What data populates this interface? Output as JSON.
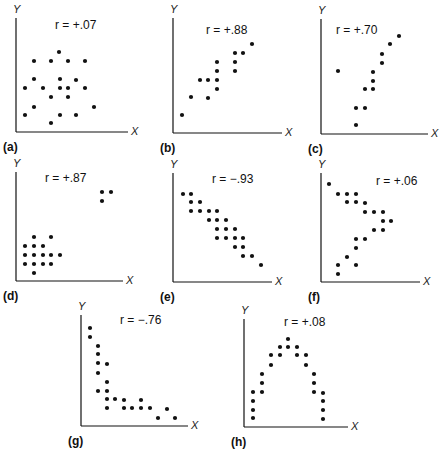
{
  "chart_data": [
    {
      "id": "a",
      "type": "scatter",
      "panel_label": "(a)",
      "annotation": "r = +.07",
      "r": 0.07,
      "xlabel": "X",
      "ylabel": "Y",
      "grid": false,
      "origin": [
        16,
        132
      ],
      "offset": [
        0,
        0
      ],
      "axis_end": [
        128,
        18
      ],
      "label_pos": [
        55,
        24
      ],
      "points": [
        [
          59,
          52
        ],
        [
          34,
          61
        ],
        [
          51,
          61
        ],
        [
          68,
          61
        ],
        [
          85,
          61
        ],
        [
          34,
          79
        ],
        [
          60,
          79
        ],
        [
          76,
          80
        ],
        [
          25,
          88
        ],
        [
          43,
          88
        ],
        [
          60,
          88
        ],
        [
          68,
          88
        ],
        [
          85,
          88
        ],
        [
          51,
          97
        ],
        [
          68,
          97
        ],
        [
          34,
          107
        ],
        [
          94,
          107
        ],
        [
          25,
          115
        ],
        [
          60,
          115
        ],
        [
          76,
          115
        ],
        [
          51,
          123
        ]
      ]
    },
    {
      "id": "b",
      "type": "scatter",
      "panel_label": "(b)",
      "annotation": "r = +.88",
      "r": 0.88,
      "xlabel": "X",
      "ylabel": "Y",
      "grid": false,
      "origin": [
        25,
        133
      ],
      "offset": [
        148,
        0
      ],
      "axis_end": [
        134,
        18
      ],
      "label_pos": [
        58,
        29
      ],
      "points": [
        [
          104,
          44
        ],
        [
          87,
          53
        ],
        [
          95,
          53
        ],
        [
          69,
          62
        ],
        [
          87,
          62
        ],
        [
          69,
          71
        ],
        [
          87,
          71
        ],
        [
          52,
          80
        ],
        [
          60,
          80
        ],
        [
          69,
          80
        ],
        [
          69,
          89
        ],
        [
          43,
          97
        ],
        [
          60,
          98
        ],
        [
          34,
          115
        ]
      ]
    },
    {
      "id": "c",
      "type": "scatter",
      "panel_label": "(c)",
      "annotation": "r = +.70",
      "r": 0.7,
      "xlabel": "X",
      "ylabel": "Y",
      "grid": false,
      "origin": [
        25,
        134
      ],
      "offset": [
        296,
        0
      ],
      "axis_end": [
        132,
        19
      ],
      "label_pos": [
        40,
        29
      ],
      "points": [
        [
          103,
          36
        ],
        [
          94,
          44
        ],
        [
          86,
          54
        ],
        [
          86,
          63
        ],
        [
          42,
          71
        ],
        [
          77,
          72
        ],
        [
          77,
          81
        ],
        [
          69,
          89
        ],
        [
          77,
          89
        ],
        [
          60,
          108
        ],
        [
          69,
          108
        ],
        [
          60,
          125
        ]
      ]
    },
    {
      "id": "d",
      "type": "scatter",
      "panel_label": "(d)",
      "annotation": "r = +.87",
      "r": 0.87,
      "xlabel": "X",
      "ylabel": "Y",
      "grid": false,
      "origin": [
        16,
        136
      ],
      "offset": [
        0,
        145
      ],
      "axis_end": [
        123,
        27
      ],
      "label_pos": [
        45,
        32
      ],
      "points": [
        [
          102,
          47
        ],
        [
          111,
          47
        ],
        [
          102,
          56
        ],
        [
          34,
          92
        ],
        [
          51,
          92
        ],
        [
          25,
          101
        ],
        [
          34,
          101
        ],
        [
          43,
          101
        ],
        [
          25,
          110
        ],
        [
          34,
          110
        ],
        [
          43,
          110
        ],
        [
          51,
          110
        ],
        [
          60,
          110
        ],
        [
          25,
          119
        ],
        [
          34,
          119
        ],
        [
          43,
          119
        ],
        [
          51,
          119
        ],
        [
          34,
          128
        ]
      ]
    },
    {
      "id": "e",
      "type": "scatter",
      "panel_label": "(e)",
      "annotation": "r = −.93",
      "r": -0.93,
      "xlabel": "X",
      "ylabel": "Y",
      "grid": false,
      "origin": [
        25,
        137
      ],
      "offset": [
        148,
        145
      ],
      "axis_end": [
        124,
        28
      ],
      "label_pos": [
        64,
        33
      ],
      "points": [
        [
          35,
          49
        ],
        [
          43,
          49
        ],
        [
          43,
          57
        ],
        [
          52,
          57
        ],
        [
          43,
          66
        ],
        [
          52,
          66
        ],
        [
          61,
          66
        ],
        [
          69,
          66
        ],
        [
          61,
          75
        ],
        [
          69,
          75
        ],
        [
          78,
          75
        ],
        [
          69,
          84
        ],
        [
          78,
          84
        ],
        [
          87,
          84
        ],
        [
          69,
          93
        ],
        [
          78,
          93
        ],
        [
          87,
          93
        ],
        [
          95,
          93
        ],
        [
          87,
          102
        ],
        [
          95,
          102
        ],
        [
          95,
          111
        ],
        [
          104,
          111
        ],
        [
          113,
          120
        ]
      ]
    },
    {
      "id": "f",
      "type": "scatter",
      "panel_label": "(f)",
      "annotation": "r = +.06",
      "r": 0.06,
      "xlabel": "X",
      "ylabel": "Y",
      "grid": false,
      "origin": [
        25,
        137
      ],
      "offset": [
        296,
        145
      ],
      "axis_end": [
        124,
        28
      ],
      "label_pos": [
        80,
        35
      ],
      "points": [
        [
          33,
          39
        ],
        [
          42,
          49
        ],
        [
          51,
          49
        ],
        [
          60,
          49
        ],
        [
          51,
          57
        ],
        [
          60,
          57
        ],
        [
          69,
          58
        ],
        [
          69,
          67
        ],
        [
          78,
          67
        ],
        [
          87,
          67
        ],
        [
          87,
          76
        ],
        [
          95,
          76
        ],
        [
          78,
          85
        ],
        [
          87,
          85
        ],
        [
          60,
          94
        ],
        [
          69,
          94
        ],
        [
          60,
          103
        ],
        [
          51,
          112
        ],
        [
          42,
          120
        ],
        [
          60,
          120
        ],
        [
          42,
          129
        ]
      ]
    },
    {
      "id": "g",
      "type": "scatter",
      "panel_label": "(g)",
      "annotation": "r = −.76",
      "r": -0.76,
      "xlabel": "X",
      "ylabel": "Y",
      "grid": false,
      "origin": [
        11,
        131
      ],
      "offset": [
        70,
        295
      ],
      "axis_end": [
        118,
        20
      ],
      "label_pos": [
        50,
        24
      ],
      "points": [
        [
          20,
          33
        ],
        [
          20,
          42
        ],
        [
          28,
          51
        ],
        [
          28,
          59
        ],
        [
          28,
          68
        ],
        [
          37,
          69
        ],
        [
          28,
          78
        ],
        [
          37,
          87
        ],
        [
          28,
          96
        ],
        [
          37,
          96
        ],
        [
          37,
          104
        ],
        [
          45,
          104
        ],
        [
          54,
          105
        ],
        [
          71,
          105
        ],
        [
          37,
          113
        ],
        [
          54,
          113
        ],
        [
          62,
          113
        ],
        [
          71,
          113
        ],
        [
          80,
          113
        ],
        [
          97,
          114
        ],
        [
          88,
          123
        ],
        [
          105,
          123
        ]
      ]
    },
    {
      "id": "h",
      "type": "scatter",
      "panel_label": "(h)",
      "annotation": "r = +.08",
      "r": 0.08,
      "xlabel": "X",
      "ylabel": "Y",
      "grid": false,
      "origin": [
        24,
        132
      ],
      "offset": [
        220,
        295
      ],
      "axis_end": [
        128,
        24
      ],
      "label_pos": [
        64,
        26
      ],
      "points": [
        [
          68,
          44
        ],
        [
          60,
          52
        ],
        [
          68,
          52
        ],
        [
          77,
          52
        ],
        [
          51,
          60
        ],
        [
          60,
          60
        ],
        [
          77,
          60
        ],
        [
          86,
          60
        ],
        [
          51,
          70
        ],
        [
          86,
          70
        ],
        [
          42,
          79
        ],
        [
          94,
          79
        ],
        [
          42,
          88
        ],
        [
          94,
          88
        ],
        [
          33,
          97
        ],
        [
          42,
          97
        ],
        [
          94,
          97
        ],
        [
          103,
          98
        ],
        [
          33,
          106
        ],
        [
          103,
          106
        ],
        [
          33,
          115
        ],
        [
          103,
          115
        ],
        [
          33,
          123
        ],
        [
          103,
          124
        ]
      ]
    }
  ]
}
